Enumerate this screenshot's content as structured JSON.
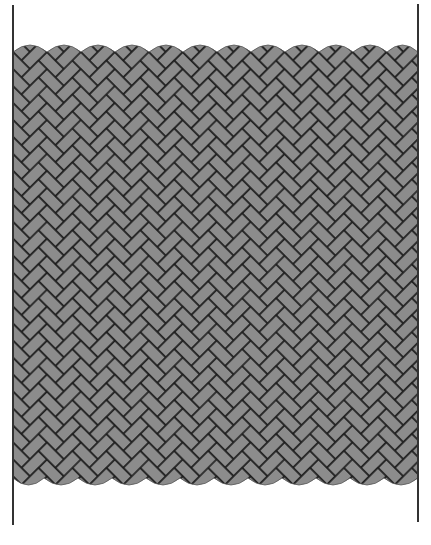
{
  "diagram": {
    "title": "",
    "colors": {
      "background": "#ffffff",
      "brick_fill": "#8c8c8c",
      "joint_stroke": "#1c1c1c",
      "boundary_line": "#333333"
    },
    "boundaries": {
      "left": {
        "x": 13,
        "y1": 5,
        "y2": 525
      },
      "right": {
        "x": 418,
        "y1": 4,
        "y2": 522
      }
    },
    "pattern": {
      "type": "herringbone",
      "brick_short_px": 12,
      "brick_long_px": 24,
      "rotation_deg": 45,
      "fill_top": 52,
      "fill_bottom": 478
    },
    "scallops": {
      "period_px": 34,
      "top_y": 52,
      "top_bulge": 7,
      "bottom_y": 478,
      "bottom_bulge": 7
    }
  }
}
